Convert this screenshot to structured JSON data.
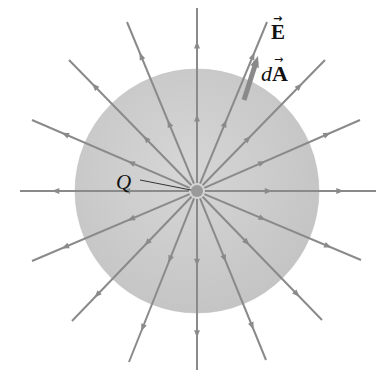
{
  "figure": {
    "colors": {
      "background": "#ffffff",
      "sphere": "#c9c9c9",
      "sphere_edge": "#bdbdbd",
      "field_line": "#8a8a8a",
      "charge": "#9a9a9a",
      "text": "#111111"
    },
    "center": [
      197,
      191
    ],
    "sphere_radius": 122,
    "charge_radius": 6,
    "labels": {
      "charge": "Q",
      "field": "E",
      "area_prefix": "d",
      "area": "A",
      "vector_arrow": "→"
    },
    "field_lines": [
      {
        "end": [
          197,
          8
        ]
      },
      {
        "end": [
          267,
          22
        ]
      },
      {
        "end": [
          325,
          60
        ]
      },
      {
        "end": [
          360,
          120
        ]
      },
      {
        "end": [
          376,
          191
        ]
      },
      {
        "end": [
          361,
          260
        ]
      },
      {
        "end": [
          322,
          320
        ]
      },
      {
        "end": [
          266,
          360
        ]
      },
      {
        "end": [
          197,
          370
        ]
      },
      {
        "end": [
          129,
          362
        ]
      },
      {
        "end": [
          72,
          321
        ]
      },
      {
        "end": [
          32,
          261
        ]
      },
      {
        "end": [
          20,
          191
        ]
      },
      {
        "end": [
          32,
          120
        ]
      },
      {
        "end": [
          69,
          60
        ]
      },
      {
        "end": [
          127,
          22
        ]
      }
    ],
    "area_vector": {
      "start": [
        244,
        100
      ],
      "end": [
        258,
        56
      ]
    },
    "charge_leader": {
      "start": [
        140,
        180
      ],
      "end": [
        196,
        191
      ]
    }
  }
}
